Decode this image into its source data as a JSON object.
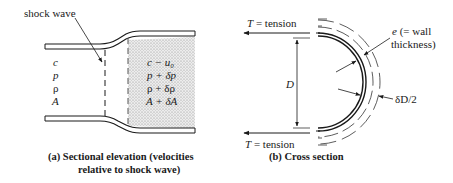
{
  "figure": {
    "panel_a": {
      "caption_line1": "(a)  Sectional elevation (velocities",
      "caption_line2": "relative to shock wave)",
      "callout": "shock wave",
      "upstream": {
        "c": "c",
        "p": "p",
        "rho": "ρ",
        "A": "A"
      },
      "downstream": {
        "c": "c − u₀",
        "p": "p + δp",
        "rho": "ρ + δρ",
        "A": "A + δA"
      }
    },
    "panel_b": {
      "caption": "(b)  Cross section",
      "tension_top_T": "T",
      "tension_top_text": " = tension",
      "tension_bottom_T": "T",
      "tension_bottom_text": " = tension",
      "diameter": "D",
      "wall_label_e": "e",
      "wall_label_line1_rest": " (= wall",
      "wall_label_line2": "thickness)",
      "expansion": "δD/2"
    }
  },
  "colors": {
    "ink": "#1a1a1a",
    "stipple": "#d9d9d9"
  }
}
